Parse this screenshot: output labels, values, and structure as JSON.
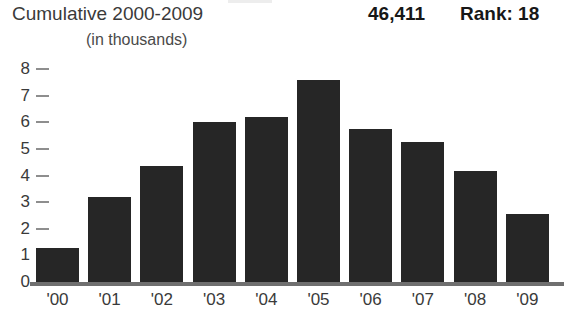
{
  "header": {
    "title": "Cumulative 2000-2009",
    "subtitle": "(in thousands)",
    "total": "46,411",
    "rank": "Rank: 18"
  },
  "colors": {
    "bar": "#262626",
    "axis": "#6f6f6f",
    "tick": "#8e8e8e",
    "text": "#3a3a3a",
    "emphasis": "#171717",
    "background": "#ffffff"
  },
  "chart_data": {
    "type": "bar",
    "title": "Cumulative 2000-2009",
    "subtitle": "(in thousands)",
    "xlabel": "",
    "ylabel": "",
    "ylim": [
      0,
      8
    ],
    "yticks": [
      0,
      1,
      2,
      3,
      4,
      5,
      6,
      7,
      8
    ],
    "ytick_labels": [
      "0",
      "1",
      "2",
      "3",
      "4",
      "5",
      "6",
      "7",
      "8"
    ],
    "grid": false,
    "legend": null,
    "units": "thousands",
    "total_label": "46,411",
    "rank_label": "Rank: 18",
    "categories": [
      "'00",
      "'01",
      "'02",
      "'03",
      "'04",
      "'05",
      "'06",
      "'07",
      "'08",
      "'09"
    ],
    "values": [
      1.3,
      3.25,
      4.4,
      6.05,
      6.25,
      7.65,
      5.8,
      5.3,
      4.2,
      2.6
    ]
  }
}
